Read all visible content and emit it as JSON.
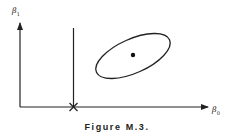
{
  "figure": {
    "caption": "Figure M.3.",
    "y_axis_label": {
      "symbol": "β",
      "subscript": "1"
    },
    "x_axis_label": {
      "symbol": "β",
      "subscript": "0"
    },
    "elements": {
      "vertical_line": "line parallel to β1 axis crossing β0 axis at marked point",
      "cross_marker": "×",
      "ellipse": "tilted confidence ellipse",
      "center_point": "dot at ellipse center"
    },
    "colors": {
      "stroke": "#222222",
      "background": "#ffffff"
    }
  }
}
